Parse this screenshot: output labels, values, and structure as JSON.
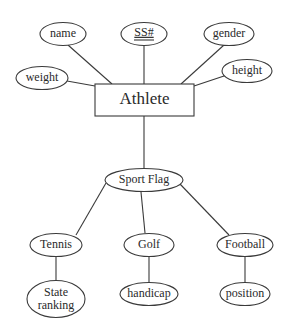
{
  "diagram": {
    "type": "ER diagram",
    "entity": {
      "label": "Athlete"
    },
    "attributes": {
      "name": "name",
      "ssn": "SS#",
      "gender": "gender",
      "weight": "weight",
      "height": "height"
    },
    "discriminator": {
      "label": "Sport Flag"
    },
    "subtypes": [
      {
        "label": "Tennis",
        "attribute_line1": "State",
        "attribute_line2": "ranking"
      },
      {
        "label": "Golf",
        "attribute": "handicap"
      },
      {
        "label": "Football",
        "attribute": "position"
      }
    ],
    "key_attribute": "SS#",
    "colors": {
      "stroke": "#3a3a3a",
      "text": "#2a2a2a",
      "background": "#ffffff"
    }
  }
}
